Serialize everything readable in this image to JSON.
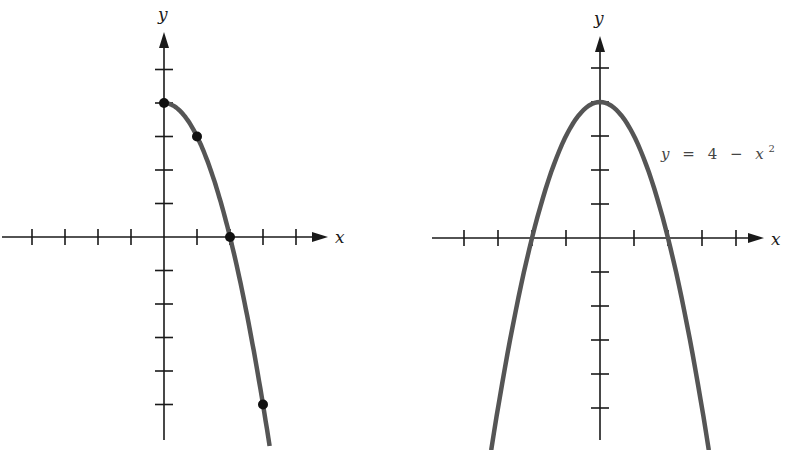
{
  "chart_data": [
    {
      "type": "line",
      "title": "",
      "xlabel": "x",
      "ylabel": "y",
      "xlim": [
        -5,
        5
      ],
      "ylim": [
        -6,
        5
      ],
      "grid": false,
      "series": [
        {
          "name": "y = 4 - x^2 (x >= 0)",
          "domain": [
            0,
            3.2
          ],
          "marked_points": [
            {
              "x": 0,
              "y": 4
            },
            {
              "x": 1,
              "y": 3
            },
            {
              "x": 2,
              "y": 0
            },
            {
              "x": 3,
              "y": -5
            }
          ]
        }
      ],
      "x_ticks": [
        -4,
        -3,
        -2,
        -1,
        1,
        2,
        3,
        4
      ],
      "y_ticks": [
        -5,
        -4,
        -3,
        -2,
        -1,
        1,
        2,
        3,
        4,
        5
      ]
    },
    {
      "type": "line",
      "title": "",
      "xlabel": "x",
      "ylabel": "y",
      "xlim": [
        -5,
        5
      ],
      "ylim": [
        -6,
        5
      ],
      "grid": false,
      "series": [
        {
          "name": "y = 4 - x^2",
          "domain": [
            -3.2,
            3.2
          ],
          "marked_points": []
        }
      ],
      "annotation": "y = 4 - x^2",
      "x_ticks": [
        -4,
        -3,
        -2,
        -1,
        1,
        2,
        3,
        4
      ],
      "y_ticks": [
        -5,
        -4,
        -3,
        -2,
        -1,
        1,
        2,
        3,
        4,
        5
      ]
    }
  ],
  "left_graph": {
    "x_label": "x",
    "y_label": "y"
  },
  "right_graph": {
    "x_label": "x",
    "y_label": "y",
    "equation": {
      "lhs": "y",
      "eq": "=",
      "const": "4",
      "minus": "−",
      "var": "x",
      "exp": "2"
    }
  },
  "colors": {
    "axis": "#1a1a1a",
    "curve": "#555555",
    "points": "#111111",
    "equation": "#444444"
  }
}
